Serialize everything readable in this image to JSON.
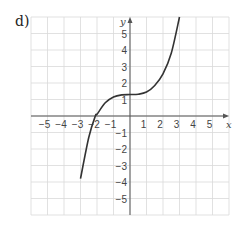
{
  "part_label": "d)",
  "chart_data": {
    "type": "line",
    "title": "",
    "xlabel": "x",
    "ylabel": "y",
    "xlim": [
      -6,
      6
    ],
    "ylim": [
      -6,
      6
    ],
    "grid": true,
    "x_ticks": [
      -5,
      -4,
      -3,
      -2,
      -1,
      1,
      2,
      3,
      4,
      5
    ],
    "y_ticks": [
      -5,
      -4,
      -3,
      -2,
      -1,
      1,
      2,
      3,
      4,
      5
    ],
    "x_tick_labels": [
      "−5",
      "−4",
      "−3",
      "−2",
      "−1",
      "1",
      "2",
      "3",
      "4",
      "5"
    ],
    "y_tick_labels": [
      "−5",
      "−4",
      "−3",
      "−2",
      "−1",
      "1",
      "2",
      "3",
      "4",
      "5"
    ],
    "series": [
      {
        "name": "curve",
        "x": [
          -3,
          -2.5,
          -2.1,
          -2,
          -1.5,
          -1,
          -0.5,
          0,
          0.5,
          1,
          1.5,
          2,
          2.5,
          3
        ],
        "y": [
          -3.8,
          -1.3,
          0,
          0.1,
          0.8,
          1.15,
          1.28,
          1.3,
          1.32,
          1.45,
          1.85,
          2.55,
          3.8,
          6
        ]
      }
    ],
    "colors": {
      "curve": "#333333",
      "grid": "#d9d9d9",
      "axis": "#555555"
    }
  }
}
